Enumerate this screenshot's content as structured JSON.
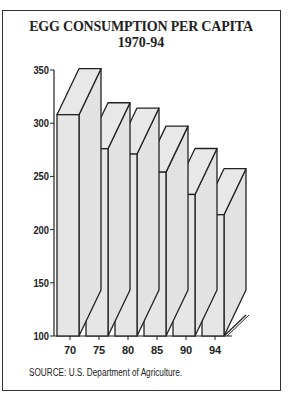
{
  "chart_data": {
    "type": "bar",
    "style": "3d",
    "title": "EGG CONSUMPTION PER CAPITA",
    "subtitle": "1970-94",
    "categories": [
      "70",
      "75",
      "80",
      "85",
      "90",
      "94"
    ],
    "values": [
      308,
      276,
      271,
      254,
      233,
      214
    ],
    "xlabel": "",
    "ylabel": "",
    "yticks": [
      "350",
      "300",
      "250",
      "200",
      "150",
      "100"
    ],
    "ylim": [
      100,
      350
    ],
    "grid": false,
    "legend": null,
    "source": "SOURCE: U.S. Department of Agriculture.",
    "colors": {
      "bar_face": "#e6e6e6",
      "bar_outline": "#222222"
    }
  }
}
